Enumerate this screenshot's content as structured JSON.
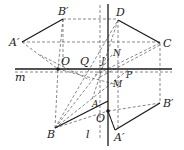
{
  "diagram": {
    "colors": {
      "stroke": "#1a1a1a",
      "dashed": "#555555",
      "background": "#ffffff"
    },
    "lines": {
      "m": {
        "label": "m",
        "type": "solid-axis"
      },
      "l": {
        "label": "l",
        "type": "solid-axis"
      }
    },
    "points": {
      "A_prime_top": {
        "label": "A′"
      },
      "B_prime_top": {
        "label": "B′"
      },
      "D": {
        "label": "D"
      },
      "C": {
        "label": "C"
      },
      "O_left": {
        "label": "O"
      },
      "Q": {
        "label": "Q"
      },
      "N": {
        "label": "N"
      },
      "P": {
        "label": "P"
      },
      "M": {
        "label": "M"
      },
      "J": {
        "label": "J"
      },
      "A": {
        "label": "A"
      },
      "O_lower": {
        "label": "O"
      },
      "B": {
        "label": "B"
      },
      "A_prime_bottom": {
        "label": "A′"
      },
      "B_prime_bottom": {
        "label": "B′"
      }
    }
  }
}
